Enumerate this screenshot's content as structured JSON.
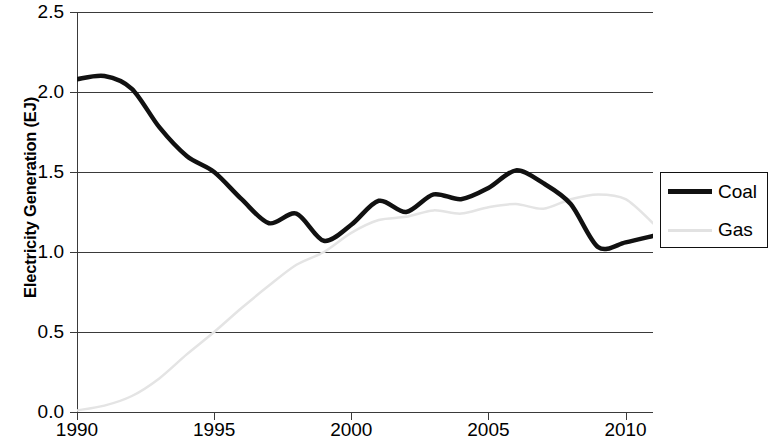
{
  "chart_data": {
    "type": "line",
    "title": "",
    "xlabel": "",
    "ylabel": "Electricity Generation (EJ)",
    "xlim": [
      1990,
      2011
    ],
    "ylim": [
      0.0,
      2.5
    ],
    "grid": true,
    "legend_position": "right",
    "y_ticks": [
      "0.0",
      "0.5",
      "1.0",
      "1.5",
      "2.0",
      "2.5"
    ],
    "y_tick_values": [
      0.0,
      0.5,
      1.0,
      1.5,
      2.0,
      2.5
    ],
    "x_ticks": [
      "1990",
      "1995",
      "2000",
      "2005",
      "2010"
    ],
    "x_tick_values": [
      1990,
      1995,
      2000,
      2005,
      2010
    ],
    "x": [
      1990,
      1991,
      1992,
      1993,
      1994,
      1995,
      1996,
      1997,
      1998,
      1999,
      2000,
      2001,
      2002,
      2003,
      2004,
      2005,
      2006,
      2007,
      2008,
      2009,
      2010,
      2011
    ],
    "series": [
      {
        "name": "Coal",
        "color": "#111111",
        "linewidth": 4.5,
        "values": [
          2.08,
          2.1,
          2.02,
          1.78,
          1.6,
          1.5,
          1.33,
          1.18,
          1.24,
          1.07,
          1.17,
          1.32,
          1.25,
          1.36,
          1.33,
          1.4,
          1.51,
          1.43,
          1.3,
          1.03,
          1.06,
          1.1
        ]
      },
      {
        "name": "Gas",
        "color": "#e4e4e4",
        "linewidth": 2.5,
        "values": [
          0.01,
          0.04,
          0.1,
          0.21,
          0.36,
          0.5,
          0.65,
          0.79,
          0.92,
          1.0,
          1.12,
          1.2,
          1.22,
          1.26,
          1.24,
          1.28,
          1.3,
          1.27,
          1.33,
          1.36,
          1.33,
          1.18
        ]
      }
    ]
  },
  "legend": {
    "entries": [
      {
        "label": "Coal",
        "swatch": "coal-line-swatch"
      },
      {
        "label": "Gas",
        "swatch": "gas-line-swatch"
      }
    ]
  }
}
